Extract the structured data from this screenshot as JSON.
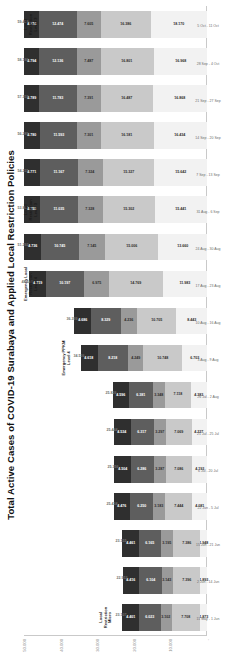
{
  "chart_data": {
    "type": "bar",
    "stacked": true,
    "title": "Total Active Cases of COVID-19 Surabaya and Applied Local Restriction Policies",
    "xlabel": "",
    "ylabel": "",
    "ylim": [
      0,
      50000
    ],
    "yticks": [
      "-",
      "10.000",
      "20.000",
      "30.000",
      "40.000",
      "50.000"
    ],
    "grid": false,
    "legend_position": "bottom",
    "colors": {
      "west-surabaya": "#f2f2f2",
      "south-surabaya": "#c9c9c9",
      "north-surabaya": "#9a9a9a",
      "east-surabaya": "#5e5e5e",
      "central-surabaya": "#2f2f2f"
    },
    "series": [
      {
        "name": "West Surabaya",
        "color": "#f2f2f2",
        "values": [
          1873,
          1893,
          1948,
          4081,
          4193,
          4227,
          4383,
          6703,
          8443,
          11983,
          13660,
          15441,
          15642,
          16434,
          16868,
          16968,
          18170
        ]
      },
      {
        "name": "South Surabaya",
        "color": "#c9c9c9",
        "values": [
          7708,
          7396,
          7386,
          7444,
          7086,
          7069,
          7118,
          10748,
          10705,
          14769,
          15006,
          15302,
          15327,
          16181,
          16487,
          16801,
          16386
        ]
      },
      {
        "name": "North Surabaya",
        "color": "#9a9a9a",
        "values": [
          3102,
          3143,
          3195,
          3183,
          3287,
          3297,
          3348,
          4249,
          4236,
          6975,
          7145,
          7328,
          7324,
          7301,
          7391,
          7487,
          7605
        ]
      },
      {
        "name": "East Surabaya",
        "color": "#5e5e5e",
        "values": [
          6023,
          6104,
          6165,
          6250,
          6286,
          6317,
          6381,
          8218,
          8329,
          10197,
          10745,
          11035,
          11167,
          11593,
          11783,
          12136,
          12474
        ]
      },
      {
        "name": "Central Surabaya",
        "color": "#2f2f2f",
        "values": [
          4401,
          4416,
          4461,
          4476,
          4504,
          4534,
          4596,
          4618,
          4686,
          4719,
          4736,
          4755,
          4771,
          4780,
          4789,
          4794,
          4774
        ]
      }
    ],
    "categories": [
      "11 May - 1 Jun",
      "2 Jun - 14 Jun",
      "15 Jun - 21 Jun",
      "22 Jun - 5 Jul",
      "6 Jul - 20 Jul",
      "21 Jul - 25 Jul",
      "26 Jul - 2 Aug",
      "3 Aug - 9 Aug",
      "10 Aug - 16 Aug",
      "17 Aug - 23 Aug",
      "24 Aug - 30 Aug",
      "31 Aug - 6 Sep",
      "7 Sep - 13 Sep",
      "14 Sep - 20 Sep",
      "21 Sep - 27 Sep",
      "28 Sep - 4 Oct",
      "5 Oct - 11 Oct"
    ],
    "segment_labels": [
      [
        "1.873",
        "7.708",
        "3.102",
        "6.023",
        "4.401"
      ],
      [
        "1.893",
        "7.396",
        "3.143",
        "6.104",
        "4.416"
      ],
      [
        "1.948",
        "7.386",
        "3.195",
        "6.165",
        "4.461"
      ],
      [
        "4.081",
        "7.444",
        "3.183",
        "6.250",
        "4.476"
      ],
      [
        "4.193",
        "7.086",
        "3.287",
        "6.286",
        "4.504"
      ],
      [
        "4.227",
        "7.069",
        "3.297",
        "6.317",
        "4.534"
      ],
      [
        "4.383",
        "7.118",
        "3.348",
        "6.381",
        "4.596"
      ],
      [
        "6.703",
        "10.748",
        "4.249",
        "8.218",
        "4.618"
      ],
      [
        "8.443",
        "10.705",
        "4.236",
        "8.329",
        "4.686"
      ],
      [
        "11.983",
        "14.769",
        "6.975",
        "10.197",
        "4.719"
      ],
      [
        "13.660",
        "15.006",
        "7.145",
        "10.745",
        "4.736"
      ],
      [
        "15.441",
        "15.302",
        "7.328",
        "11.035",
        "4.755"
      ],
      [
        "15.642",
        "15.327",
        "7.324",
        "11.167",
        "4.771"
      ],
      [
        "16.434",
        "16.181",
        "7.301",
        "11.593",
        "4.780"
      ],
      [
        "16.868",
        "16.487",
        "7.391",
        "11.783",
        "4.789"
      ],
      [
        "16.968",
        "16.801",
        "7.487",
        "12.136",
        "4.794"
      ],
      [
        "18.170",
        "16.386",
        "7.605",
        "12.474",
        "4.774"
      ]
    ],
    "totals": [
      "23.107",
      "22.952",
      "23.155",
      "25.434",
      "25.356",
      "25.444",
      "25.826",
      "34.536",
      "36.399",
      "48.643",
      "51.292",
      "53.861",
      "54.231",
      "56.289",
      "57.318",
      "58.186",
      "59.409"
    ],
    "annotations": [
      {
        "label": "Local\nRestriction\nMicro",
        "at_index": 0
      },
      {
        "label": "Emergency PPKM\nLevel 4",
        "at_index": 7
      },
      {
        "label": "Emergency Local\nRestriction\nLevel 4",
        "at_index": 9
      },
      {
        "label": "Local\nRestriction\nLevel 3",
        "at_index": 11
      },
      {
        "label": "Local\nRestriction\nLevel 3",
        "at_index": 16
      }
    ]
  }
}
